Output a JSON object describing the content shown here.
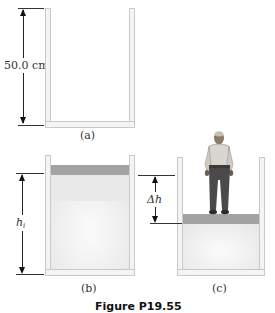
{
  "figure": {
    "caption": "Figure P19.55",
    "panels": [
      {
        "id": "a",
        "label": "(a)",
        "dimension_label": "50.0 cm"
      },
      {
        "id": "b",
        "label": "(b)",
        "dimension_label": "h",
        "dimension_subscript": "i"
      },
      {
        "id": "c",
        "label": "(c)",
        "dimension_label": "Δh"
      }
    ]
  },
  "colors": {
    "piston": "#a3a3a3",
    "wall": "#f4f4f4",
    "wall_border": "#c9c9c9",
    "gas_fill": "#ececec"
  }
}
